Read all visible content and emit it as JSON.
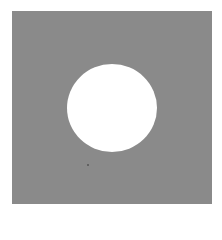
{
  "figure": {
    "colors": {
      "square": "#8a8a8a",
      "hole": "#ffffff",
      "background": "#ffffff"
    },
    "shapes": [
      {
        "type": "square",
        "x": 12,
        "y": 11,
        "width": 200,
        "height": 193
      },
      {
        "type": "circle",
        "cx": 112,
        "cy": 108,
        "r": 45
      }
    ]
  }
}
